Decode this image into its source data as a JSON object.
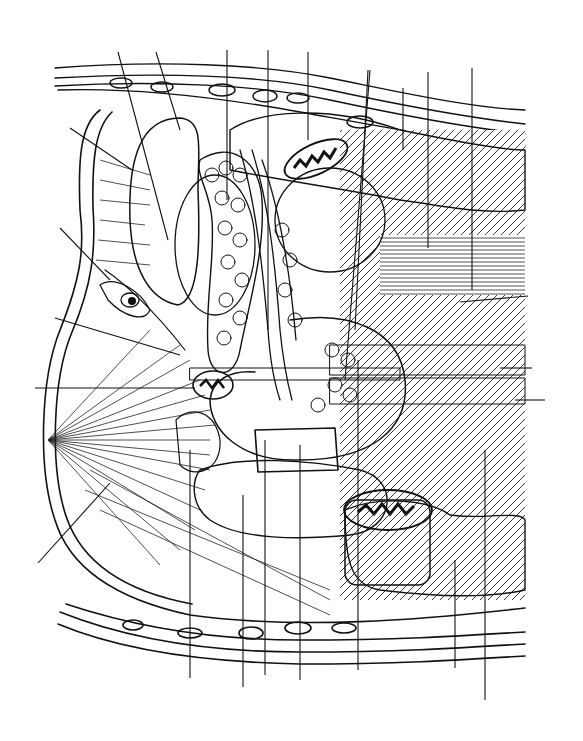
{
  "figure": {
    "type": "anatomical-illustration",
    "style": "black-and-white pen hatching",
    "background": "#ffffff",
    "ink_color": "#111111",
    "dark_tone": "#555555",
    "mid_tone": "#9a9a9a",
    "light_tone": "#d8d8d8",
    "labels": [],
    "leader_lines": {
      "top": [
        {
          "x1": 118,
          "y1": 52,
          "x2": 168,
          "y2": 240
        },
        {
          "x1": 156,
          "y1": 52,
          "x2": 180,
          "y2": 130
        },
        {
          "x1": 227,
          "y1": 50,
          "x2": 227,
          "y2": 200
        },
        {
          "x1": 268,
          "y1": 50,
          "x2": 268,
          "y2": 330
        },
        {
          "x1": 308,
          "y1": 52,
          "x2": 308,
          "y2": 140
        },
        {
          "x1": 368,
          "y1": 70,
          "x2": 355,
          "y2": 330
        },
        {
          "x1": 370,
          "y1": 70,
          "x2": 345,
          "y2": 380
        },
        {
          "x1": 403,
          "y1": 88,
          "x2": 403,
          "y2": 150
        },
        {
          "x1": 428,
          "y1": 72,
          "x2": 428,
          "y2": 248
        },
        {
          "x1": 472,
          "y1": 68,
          "x2": 472,
          "y2": 290
        }
      ],
      "left": [
        {
          "x1": 70,
          "y1": 128,
          "x2": 132,
          "y2": 170
        },
        {
          "x1": 60,
          "y1": 228,
          "x2": 110,
          "y2": 280
        },
        {
          "x1": 55,
          "y1": 318,
          "x2": 180,
          "y2": 355
        },
        {
          "x1": 35,
          "y1": 388,
          "x2": 195,
          "y2": 388
        },
        {
          "x1": 38,
          "y1": 563,
          "x2": 110,
          "y2": 483
        }
      ],
      "right": [
        {
          "x1": 460,
          "y1": 302,
          "x2": 528,
          "y2": 296
        },
        {
          "x1": 500,
          "y1": 368,
          "x2": 532,
          "y2": 368
        },
        {
          "x1": 515,
          "y1": 400,
          "x2": 545,
          "y2": 400
        }
      ],
      "bottom": [
        {
          "x1": 190,
          "y1": 450,
          "x2": 190,
          "y2": 678
        },
        {
          "x1": 243,
          "y1": 495,
          "x2": 243,
          "y2": 687
        },
        {
          "x1": 265,
          "y1": 440,
          "x2": 265,
          "y2": 675
        },
        {
          "x1": 300,
          "y1": 445,
          "x2": 300,
          "y2": 680
        },
        {
          "x1": 358,
          "y1": 360,
          "x2": 358,
          "y2": 670
        },
        {
          "x1": 455,
          "y1": 560,
          "x2": 455,
          "y2": 668
        },
        {
          "x1": 485,
          "y1": 450,
          "x2": 485,
          "y2": 700
        }
      ]
    }
  }
}
